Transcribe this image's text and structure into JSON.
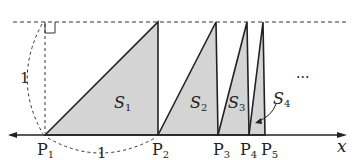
{
  "diagram": {
    "axis": {
      "label": "x"
    },
    "points": [
      {
        "name": "P",
        "sub": "1"
      },
      {
        "name": "P",
        "sub": "2"
      },
      {
        "name": "P",
        "sub": "3"
      },
      {
        "name": "P",
        "sub": "4"
      },
      {
        "name": "P",
        "sub": "5"
      }
    ],
    "areas": [
      {
        "name": "S",
        "sub": "1"
      },
      {
        "name": "S",
        "sub": "2"
      },
      {
        "name": "S",
        "sub": "3"
      },
      {
        "name": "S",
        "sub": "4"
      }
    ],
    "height_label": "1",
    "base_label": "1",
    "ellipsis": "···",
    "colors": {
      "shade": "#d4d4d4",
      "line": "#222222"
    }
  }
}
